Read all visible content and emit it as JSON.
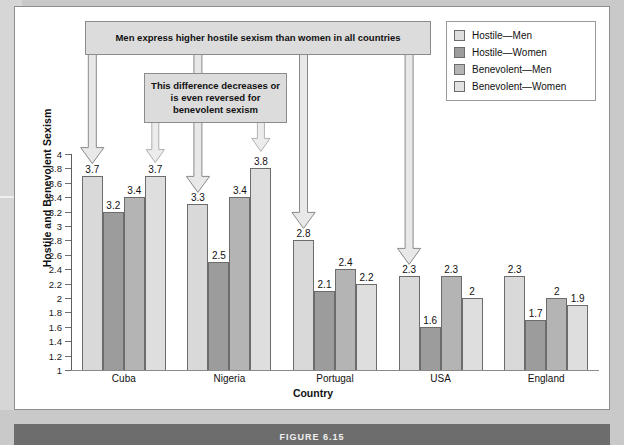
{
  "figure": {
    "caption": "FIGURE 6.15"
  },
  "legend": {
    "items": [
      {
        "label": "Hostile—Men",
        "color": "#dedede"
      },
      {
        "label": "Hostile—Women",
        "color": "#9c9c9c"
      },
      {
        "label": "Benevolent—Men",
        "color": "#b4b4b4"
      },
      {
        "label": "Benevolent—Women",
        "color": "#e2e2e2"
      }
    ]
  },
  "callouts": [
    {
      "id": "top",
      "text": "Men express higher hostile sexism than women in all countries"
    },
    {
      "id": "bottom",
      "text": "This difference decreases or is even reversed for benevolent sexism"
    }
  ],
  "chart_data": {
    "type": "bar",
    "title": "",
    "xlabel": "Country",
    "ylabel": "Hostile and Benevolent Sexism",
    "ylim": [
      1,
      4
    ],
    "ytick_step": 0.2,
    "yticks": [
      "4",
      "3.8",
      "3.6",
      "3.4",
      "3.2",
      "3",
      "2.8",
      "2.6",
      "2.4",
      "2.2",
      "2",
      "1.8",
      "1.6",
      "1.4",
      "1.2",
      "1"
    ],
    "grid": false,
    "legend_position": "top-right",
    "categories": [
      "Cuba",
      "Nigeria",
      "Portugal",
      "USA",
      "England"
    ],
    "series": [
      {
        "name": "Hostile—Men",
        "values": [
          3.7,
          3.3,
          2.8,
          2.3,
          2.3
        ]
      },
      {
        "name": "Hostile—Women",
        "values": [
          3.2,
          2.5,
          2.1,
          1.6,
          1.7
        ]
      },
      {
        "name": "Benevolent—Men",
        "values": [
          3.4,
          3.4,
          2.4,
          2.3,
          2.0
        ]
      },
      {
        "name": "Benevolent—Women",
        "values": [
          3.7,
          3.8,
          2.2,
          2.0,
          1.9
        ]
      }
    ],
    "data_labels": [
      [
        "3.7",
        "3.2",
        "3.4",
        "3.7"
      ],
      [
        "3.3",
        "2.5",
        "3.4",
        "3.8"
      ],
      [
        "2.8",
        "2.1",
        "2.4",
        "2.2"
      ],
      [
        "2.3",
        "1.6",
        "2.3",
        "2"
      ],
      [
        "2.3",
        "1.7",
        "2",
        "1.9"
      ]
    ],
    "annotations": [
      "Men express higher hostile sexism than women in all countries",
      "This difference decreases or is even reversed for benevolent sexism"
    ]
  }
}
